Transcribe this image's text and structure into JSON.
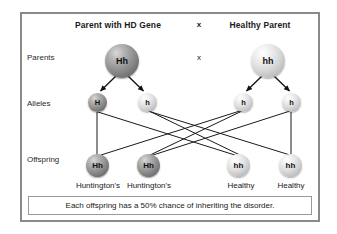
{
  "diagram": {
    "headers": {
      "left": "Parent with HD Gene",
      "cross": "x",
      "right": "Healthy Parent"
    },
    "row_labels": {
      "parents": "Parents",
      "alleles": "Alleles",
      "offspring": "Offspring"
    },
    "cross_symbol": "x",
    "parents": [
      {
        "genotype": "Hh",
        "shade": "dark",
        "side": "left"
      },
      {
        "genotype": "hh",
        "shade": "light",
        "side": "right"
      }
    ],
    "alleles": [
      {
        "allele": "H",
        "shade": "dark"
      },
      {
        "allele": "h",
        "shade": "light"
      },
      {
        "allele": "h",
        "shade": "light"
      },
      {
        "allele": "h",
        "shade": "light"
      }
    ],
    "offspring": [
      {
        "genotype": "Hh",
        "shade": "dark",
        "outcome": "Huntington's"
      },
      {
        "genotype": "Hh",
        "shade": "dark",
        "outcome": "Huntington's"
      },
      {
        "genotype": "hh",
        "shade": "light",
        "outcome": "Healthy"
      },
      {
        "genotype": "hh",
        "shade": "light",
        "outcome": "Healthy"
      }
    ],
    "caption": "Each offspring has a 50% chance of inheriting the disorder.",
    "colors": {
      "frame_border": "#8a8a8a",
      "caption_border": "#9a9a9a",
      "line": "#1a1a1a",
      "text": "#1a1a1a",
      "background": "#ffffff"
    }
  }
}
